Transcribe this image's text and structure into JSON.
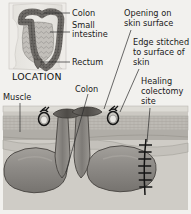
{
  "figure": {
    "inset": {
      "caption": "LOCATION",
      "labels": [
        {
          "id": "colon",
          "text": "Colon"
        },
        {
          "id": "small-intestine",
          "line1": "Small",
          "line2": "intestine"
        },
        {
          "id": "rectum",
          "text": "Rectum"
        }
      ]
    },
    "main": {
      "labels": [
        {
          "id": "muscle",
          "text": "Muscle"
        },
        {
          "id": "colon",
          "text": "Colon"
        },
        {
          "id": "opening-on-skin-surface",
          "line1": "Opening on",
          "line2": "skin surface"
        },
        {
          "id": "edge-stitched",
          "line1": "Edge stitched",
          "line2": "to surface of",
          "line3": "skin"
        },
        {
          "id": "healing-colectomy-site",
          "line1": "Healing",
          "line2": "colectomy",
          "line3": "site"
        }
      ]
    },
    "colors": {
      "background": "#f2f1ee",
      "skin_surface": "#d8d6d0",
      "fat_layer": "#bdbab4",
      "muscle_layer": "#a9a6a0",
      "bowel_body": "#8f8c88",
      "bowel_dark": "#6e6b67",
      "bowel_light": "#b6b3ae",
      "stoma_dark": "#55524e",
      "suture": "#1c1c1c",
      "outline": "#3a3a3a",
      "text": "#1a1a1a"
    }
  }
}
